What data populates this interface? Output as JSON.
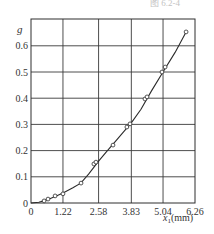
{
  "chart_data": {
    "type": "line",
    "title": "",
    "xlabel": "x₁(mm)",
    "ylabel": "g",
    "xlim": [
      0,
      6.26
    ],
    "ylim": [
      0,
      0.67
    ],
    "x_ticks": [
      0,
      1.22,
      2.58,
      3.83,
      5.04,
      6.26
    ],
    "x_tick_labels": [
      "0",
      "1.22",
      "2.58",
      "3.83",
      "5.04",
      "6.26"
    ],
    "y_ticks": [
      0,
      0.1,
      0.2,
      0.3,
      0.4,
      0.5,
      0.6
    ],
    "y_tick_labels": [
      "0",
      "0.1",
      "0.2",
      "0.3",
      "0.4",
      "0.5",
      "0.6"
    ],
    "grid": true,
    "legend": null,
    "series": [
      {
        "name": "measured",
        "marker": "open-circle",
        "line": true,
        "x": [
          0.5,
          0.65,
          0.92,
          1.22,
          1.91,
          2.4,
          2.48,
          3.13,
          3.66,
          3.78,
          4.35,
          4.43,
          5.0,
          5.12,
          5.92
        ],
        "y": [
          0.008,
          0.015,
          0.027,
          0.035,
          0.076,
          0.149,
          0.156,
          0.221,
          0.29,
          0.302,
          0.397,
          0.405,
          0.5,
          0.519,
          0.653
        ]
      }
    ],
    "curve": {
      "x": [
        0,
        0.3,
        0.6,
        0.9,
        1.22,
        1.6,
        1.9,
        2.2,
        2.58,
        2.9,
        3.2,
        3.5,
        3.83,
        4.2,
        4.6,
        5.04,
        5.5,
        5.92
      ],
      "y": [
        0,
        0.003,
        0.012,
        0.024,
        0.038,
        0.058,
        0.076,
        0.11,
        0.16,
        0.198,
        0.232,
        0.268,
        0.306,
        0.358,
        0.428,
        0.5,
        0.575,
        0.653
      ]
    },
    "colors": {
      "line": "#2b2b2b",
      "grid": "#3a3a3a",
      "marker": "#2b2b2b"
    }
  },
  "caption_fragment": "图 6.2-4"
}
